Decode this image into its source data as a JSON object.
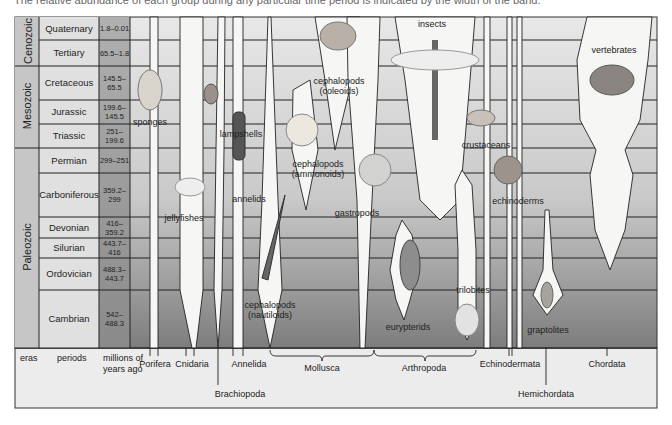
{
  "caption": "The relative abundance of each group during any particular time period is indicated by the width of the band.",
  "axis_labels": {
    "eras": "eras",
    "periods": "periods",
    "mya": "millions of years ago"
  },
  "eras": [
    {
      "name": "Cenozoic",
      "y0": 17,
      "y1": 66
    },
    {
      "name": "Mesozoic",
      "y0": 66,
      "y1": 148
    },
    {
      "name": "Paleozoic",
      "y0": 148,
      "y1": 348
    }
  ],
  "periods": [
    {
      "name": "Quaternary",
      "mya": "1.8–0.01",
      "y0": 17,
      "y1": 40
    },
    {
      "name": "Tertiary",
      "mya": "65.5–1.8",
      "y0": 40,
      "y1": 66
    },
    {
      "name": "Cretaceous",
      "mya": "145.5–65.5",
      "y0": 66,
      "y1": 100
    },
    {
      "name": "Jurassic",
      "mya": "199.6–145.5",
      "y0": 100,
      "y1": 124
    },
    {
      "name": "Triassic",
      "mya": "251–199.6",
      "y0": 124,
      "y1": 148
    },
    {
      "name": "Permian",
      "mya": "299–251",
      "y0": 148,
      "y1": 173
    },
    {
      "name": "Carboniferous",
      "mya": "359.2–299",
      "y0": 173,
      "y1": 217
    },
    {
      "name": "Devonian",
      "mya": "416–359.2",
      "y0": 217,
      "y1": 238
    },
    {
      "name": "Silurian",
      "mya": "443.7–416",
      "y0": 238,
      "y1": 258
    },
    {
      "name": "Ordovician",
      "mya": "488.3–443.7",
      "y0": 258,
      "y1": 290
    },
    {
      "name": "Cambrian",
      "mya": "542–488.3",
      "y0": 290,
      "y1": 348
    }
  ],
  "groups": [
    {
      "name": "sponges",
      "x": 150,
      "y": 117
    },
    {
      "name": "jellyfishes",
      "x": 184,
      "y": 213
    },
    {
      "name": "lampshells",
      "x": 241,
      "y": 129
    },
    {
      "name": "annelids",
      "x": 249,
      "y": 194
    },
    {
      "name": "cephalopods\n(coleoids)",
      "x": 339,
      "y": 76
    },
    {
      "name": "cephalopods\n(ammonoids)",
      "x": 318,
      "y": 159
    },
    {
      "name": "cephalopods\n(nautiloids)",
      "x": 270,
      "y": 300
    },
    {
      "name": "gastropods",
      "x": 357,
      "y": 208
    },
    {
      "name": "insects",
      "x": 432,
      "y": 19
    },
    {
      "name": "crustaceans",
      "x": 486,
      "y": 140
    },
    {
      "name": "eurypterids",
      "x": 408,
      "y": 322
    },
    {
      "name": "trilobites",
      "x": 473,
      "y": 285
    },
    {
      "name": "echinoderms",
      "x": 518,
      "y": 196
    },
    {
      "name": "graptolites",
      "x": 548,
      "y": 325
    },
    {
      "name": "vertebrates",
      "x": 614,
      "y": 45
    }
  ],
  "phyla": [
    {
      "name": "Porifera",
      "x": 155,
      "y": 359,
      "tick_x": [
        150,
        158
      ]
    },
    {
      "name": "Cnidaria",
      "x": 192,
      "y": 359,
      "tick_x": [
        186,
        194
      ]
    },
    {
      "name": "Brachiopoda",
      "x": 240,
      "y": 389,
      "tick_x": [
        218
      ],
      "long": true
    },
    {
      "name": "Annelida",
      "x": 249,
      "y": 359,
      "tick_x": [
        233,
        243
      ]
    },
    {
      "name": "Mollusca",
      "x": 322,
      "y": 363,
      "bracket": [
        270,
        374
      ]
    },
    {
      "name": "Arthropoda",
      "x": 424,
      "y": 363,
      "bracket": [
        374,
        476
      ]
    },
    {
      "name": "Echinodermata",
      "x": 510,
      "y": 359,
      "tick_x": [
        509,
        512
      ]
    },
    {
      "name": "Hemichordata",
      "x": 546,
      "y": 389,
      "tick_x": [
        546
      ],
      "long": true
    },
    {
      "name": "Chordata",
      "x": 607,
      "y": 359,
      "tick_x": [
        607
      ]
    }
  ],
  "colors": {
    "row_top": "#e6e6e6",
    "row_bottom": "#8c8c8c",
    "band_fill": "#f7f7f5",
    "line": "#222222",
    "mya_col": "#a8a8a8",
    "era_col": "#c4c4c4",
    "legend_bg": "#ececec"
  }
}
